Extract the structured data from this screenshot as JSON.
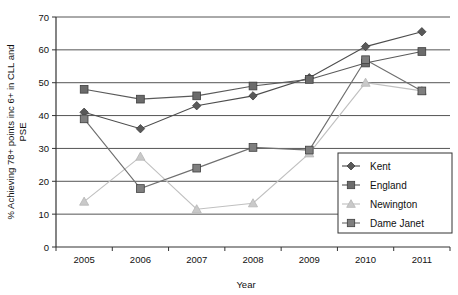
{
  "chart_data": {
    "type": "line",
    "title": "",
    "xlabel": "Year",
    "ylabel": "% Achieving 78+ points inc 6+ in CLL and PSE",
    "categories": [
      "2005",
      "2006",
      "2007",
      "2008",
      "2009",
      "2010",
      "2011"
    ],
    "x": [
      2005,
      2006,
      2007,
      2008,
      2009,
      2010,
      2011
    ],
    "ylim": [
      0,
      70
    ],
    "yticks": [
      "0",
      "10",
      "20",
      "30",
      "40",
      "50",
      "60",
      "70"
    ],
    "ytick_values": [
      0,
      10,
      20,
      30,
      40,
      50,
      60,
      70
    ],
    "grid": "horizontal",
    "legend_position": "lower-right",
    "series": [
      {
        "name": "Kent",
        "marker": "diamond",
        "color": "#595959",
        "line_color": "#4d4d4d",
        "values": [
          41,
          36,
          43,
          46,
          51.5,
          61,
          65.5
        ]
      },
      {
        "name": "England",
        "marker": "square",
        "color": "#6b6b6b",
        "line_color": "#5a5a5a",
        "values": [
          48,
          45,
          46,
          49,
          51,
          56,
          59.5
        ]
      },
      {
        "name": "Newington",
        "marker": "triangle",
        "color": "#c9c9c9",
        "line_color": "#c0c0c0",
        "values": [
          13.8,
          27.5,
          11.5,
          13.3,
          28.5,
          50,
          47.5
        ]
      },
      {
        "name": "Dame Janet",
        "marker": "square",
        "color": "#7f7f7f",
        "line_color": "#6f6f6f",
        "values": [
          39,
          17.8,
          24,
          30.3,
          29.5,
          57,
          47.5
        ]
      }
    ]
  },
  "axes": {
    "x_title": "Year",
    "y_title_line1": "% Achieving 78+ points inc 6+ in CLL and",
    "y_title_line2": "PSE"
  },
  "legend": {
    "items": [
      {
        "label": "Kent"
      },
      {
        "label": "England"
      },
      {
        "label": "Newington"
      },
      {
        "label": "Dame Janet"
      }
    ]
  },
  "colors": {
    "axis": "#333333",
    "grid": "#555555",
    "background": "#ffffff",
    "kent": "#595959",
    "england": "#6b6b6b",
    "newington": "#c9c9c9",
    "dame_janet": "#7f7f7f"
  }
}
